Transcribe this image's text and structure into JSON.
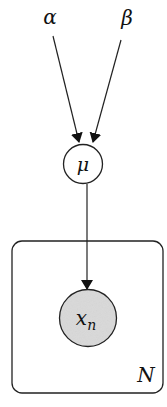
{
  "diagram": {
    "type": "plate-notation-graphical-model",
    "nodes": {
      "alpha": {
        "label": "α",
        "kind": "hyperparameter"
      },
      "beta": {
        "label": "β",
        "kind": "hyperparameter"
      },
      "mu": {
        "label": "μ",
        "kind": "latent",
        "fill": "#ffffff"
      },
      "xn": {
        "label": "x",
        "subscript": "n",
        "kind": "observed",
        "fill": "#d9d9d9"
      }
    },
    "edges": [
      {
        "from": "alpha",
        "to": "mu"
      },
      {
        "from": "beta",
        "to": "mu"
      },
      {
        "from": "mu",
        "to": "xn"
      }
    ],
    "plate": {
      "label": "N",
      "contains": [
        "xn"
      ]
    }
  }
}
